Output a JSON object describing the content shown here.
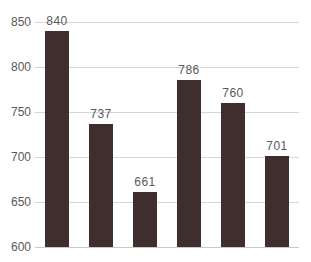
{
  "chart_data": {
    "type": "bar",
    "categories": [
      "",
      "",
      "",
      "",
      "",
      ""
    ],
    "values": [
      840,
      737,
      661,
      786,
      760,
      701
    ],
    "data_labels": [
      "840",
      "737",
      "661",
      "786",
      "760",
      "701"
    ],
    "title": "",
    "xlabel": "",
    "ylabel": "",
    "ylim": [
      600,
      850
    ],
    "yticks": [
      600,
      650,
      700,
      750,
      800,
      850
    ],
    "grid": true,
    "legend": false,
    "colors": {
      "bar": "#3e2e2e",
      "gridline": "#d6d6d6",
      "baseline": "#c9c9c9",
      "tick_label": "#595959",
      "data_label": "#595959",
      "background": "#ffffff"
    }
  }
}
